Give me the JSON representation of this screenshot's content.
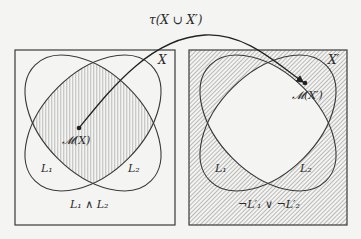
{
  "diagram": {
    "arrow_label": "τ(X ∪ X′)",
    "left_panel": {
      "set_label": "X",
      "point_label": "𝓜(X)",
      "ellipse1_label": "L₁",
      "ellipse2_label": "L₂",
      "region_label": "L₁ ∧ L₂",
      "hatched_region": "intersection"
    },
    "right_panel": {
      "set_label": "X′",
      "point_label": "𝓜(X′)",
      "ellipse1_label": "L₁",
      "ellipse2_label": "L₂",
      "region_label": "¬L′₁ ∨ ¬L′₂",
      "hatched_region": "complement of intersection"
    },
    "colors": {
      "background": "#f4f4f2",
      "stroke": "#3a3a3a",
      "hatch": "#8a8a8a"
    }
  }
}
